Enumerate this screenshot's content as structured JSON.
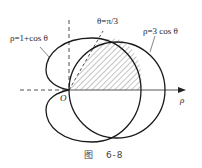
{
  "labels": {
    "cardioid": "ρ=1+cos θ",
    "circle": "ρ=3 cos θ",
    "ray": "θ=π/3",
    "origin": "O",
    "axis": "ρ"
  },
  "caption": {
    "prefix": "图",
    "number": "6-8"
  },
  "colors": {
    "stroke": "#1a1a1a",
    "hatch": "#555555"
  }
}
